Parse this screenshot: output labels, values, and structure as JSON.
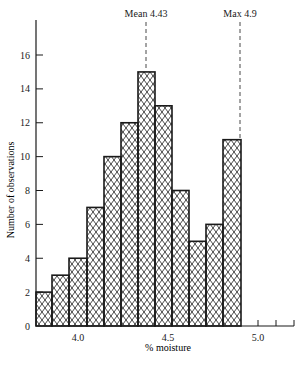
{
  "chart_data": {
    "type": "bar",
    "title": "",
    "xlabel": "% moisture",
    "ylabel": "Number of observations",
    "bin_edges": [
      3.79,
      3.88,
      3.97,
      4.07,
      4.16,
      4.26,
      4.35,
      4.44,
      4.54,
      4.64,
      4.73,
      4.82,
      4.92
    ],
    "categories": [
      "3.79-3.88",
      "3.88-3.97",
      "3.97-4.07",
      "4.07-4.16",
      "4.16-4.26",
      "4.26-4.35",
      "4.35-4.44",
      "4.44-4.54",
      "4.54-4.64",
      "4.64-4.73",
      "4.73-4.82",
      "4.82-4.92"
    ],
    "values": [
      2,
      3,
      4,
      7,
      10,
      12,
      15,
      13,
      8,
      5,
      6,
      11
    ],
    "xlim": [
      3.79,
      5.2
    ],
    "ylim": [
      0,
      18
    ],
    "x_ticks": [
      {
        "value": 4.0,
        "label": "4.0"
      },
      {
        "value": 4.5,
        "label": "4.5"
      },
      {
        "value": 5.0,
        "label": "5.0"
      }
    ],
    "x_minor_ticks": [
      5.1,
      5.2
    ],
    "y_ticks": [
      0,
      2,
      4,
      6,
      8,
      10,
      12,
      14,
      16
    ],
    "annotations": [
      {
        "label": "Mean 4.43",
        "x": 4.43,
        "style": "dashed-vertical"
      },
      {
        "label": "Max 4.9",
        "x": 4.92,
        "style": "dashed-vertical"
      }
    ],
    "fill_pattern": "cross-hatch",
    "grid": false,
    "legend": null
  },
  "labels": {
    "xlabel": "% moisture",
    "ylabel": "Number of observations",
    "mean": "Mean 4.43",
    "max": "Max 4.9"
  }
}
